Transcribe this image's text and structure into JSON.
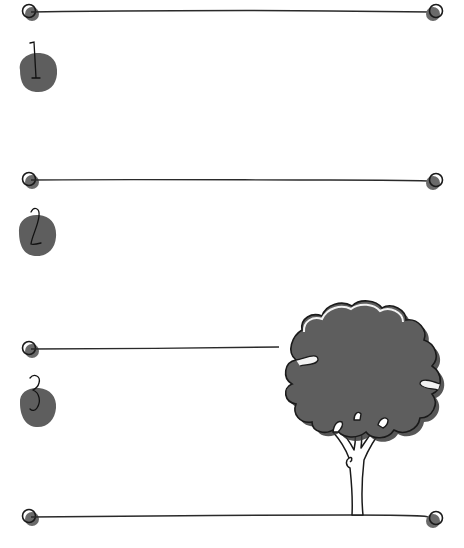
{
  "worksheet": {
    "colors": {
      "ink": "#1a1a1a",
      "fill": "#5e5e5e",
      "paper": "#ffffff",
      "highlight": "#f2f2f2"
    },
    "rows": [
      {
        "number": "1",
        "line_y": 12,
        "badge_y": 74,
        "line_end_x": 434
      },
      {
        "number": "2",
        "line_y": 180,
        "badge_y": 236,
        "line_end_x": 434
      },
      {
        "number": "3",
        "line_y": 349,
        "badge_y": 407,
        "line_end_x": 280
      },
      {
        "number": "",
        "line_y": 517,
        "badge_y": null,
        "line_end_x": 434
      }
    ],
    "illustration": {
      "subject": "tree-icon"
    }
  }
}
